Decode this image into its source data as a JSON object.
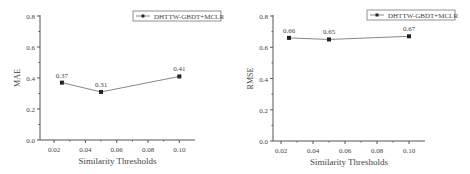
{
  "chart_data": [
    {
      "type": "line",
      "title": "",
      "xlabel": "Similarity Thresholds",
      "ylabel": "MAE",
      "x": [
        0.025,
        0.05,
        0.1
      ],
      "series": [
        {
          "name": "DHTTW-GBDT+MCLR",
          "values": [
            0.37,
            0.31,
            0.41
          ]
        }
      ],
      "data_labels": [
        "0.37",
        "0.31",
        "0.41"
      ],
      "xticks": [
        "0.02",
        "0.04",
        "0.06",
        "0.08",
        "0.10"
      ],
      "yticks": [
        "0.0",
        "0.2",
        "0.4",
        "0.6",
        "0.8"
      ],
      "xlim": [
        0.011,
        0.11
      ],
      "ylim": [
        0.0,
        0.8
      ],
      "grid": false,
      "legend_position": "upper right"
    },
    {
      "type": "line",
      "title": "",
      "xlabel": "Similarity Thresholds",
      "ylabel": "RMSE",
      "x": [
        0.025,
        0.05,
        0.1
      ],
      "series": [
        {
          "name": "DHTTW-GBDT+MCLR",
          "values": [
            0.66,
            0.65,
            0.67
          ]
        }
      ],
      "data_labels": [
        "0.66",
        "0.65",
        "0.67"
      ],
      "xticks": [
        "0.02",
        "0.04",
        "0.06",
        "0.08",
        "0.10"
      ],
      "yticks": [
        "0.0",
        "0.2",
        "0.4",
        "0.6",
        "0.8"
      ],
      "xlim": [
        0.015,
        0.11
      ],
      "ylim": [
        0.0,
        0.8
      ],
      "grid": false,
      "legend_position": "upper right"
    }
  ],
  "colors": {
    "axis": "#555555",
    "line": "#888888",
    "marker": "#222222",
    "text": "#444444"
  }
}
